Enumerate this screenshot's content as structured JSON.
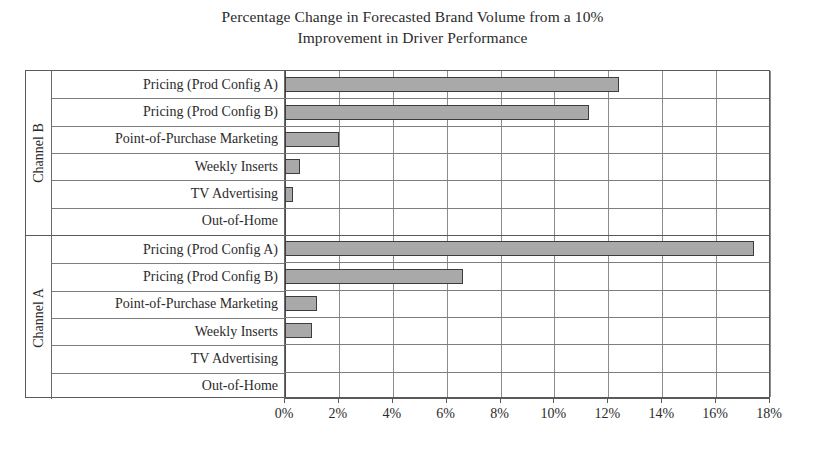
{
  "title": {
    "line1": "Percentage Change in Forecasted Brand Volume from a 10%",
    "line2": "Improvement in Driver Performance"
  },
  "chart_data": {
    "type": "bar",
    "orientation": "horizontal",
    "title": "Percentage Change in Forecasted Brand Volume from a 10% Improvement in Driver Performance",
    "xlabel": "",
    "ylabel": "",
    "xlim": [
      0,
      18
    ],
    "x_tick_labels": [
      "0%",
      "2%",
      "4%",
      "6%",
      "8%",
      "10%",
      "12%",
      "14%",
      "16%",
      "18%"
    ],
    "x_tick_values": [
      0,
      2,
      4,
      6,
      8,
      10,
      12,
      14,
      16,
      18
    ],
    "grid": true,
    "legend": "none",
    "groups": [
      {
        "name": "Channel B",
        "categories": [
          "Pricing (Prod Config A)",
          "Pricing (Prod Config B)",
          "Point-of-Purchase Marketing",
          "Weekly Inserts",
          "TV Advertising",
          "Out-of-Home"
        ],
        "values": [
          12.4,
          11.3,
          2.0,
          0.55,
          0.3,
          0.0
        ]
      },
      {
        "name": "Channel A",
        "categories": [
          "Pricing (Prod Config A)",
          "Pricing (Prod Config B)",
          "Point-of-Purchase Marketing",
          "Weekly Inserts",
          "TV Advertising",
          "Out-of-Home"
        ],
        "values": [
          17.4,
          6.6,
          1.2,
          1.0,
          0.0,
          0.0
        ]
      }
    ],
    "colors": {
      "bar_fill": "#a9a9a9",
      "bar_border": "#3d3d3d",
      "gridline": "#8c8c8c",
      "frame": "#5a5a5a",
      "text": "#2b2b2b",
      "background": "#ffffff"
    }
  }
}
